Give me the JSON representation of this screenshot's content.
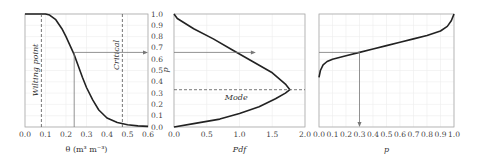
{
  "chart_data": [
    {
      "type": "line",
      "panel": "left",
      "xlabel": "θ (m³ m⁻³)",
      "ylabel": "p",
      "xlim": [
        0.0,
        0.6
      ],
      "ylim": [
        0.0,
        1.0
      ],
      "xticks": [
        "0.0",
        "0.1",
        "0.2",
        "0.3",
        "0.4",
        "0.5",
        "0.6"
      ],
      "yticks": [
        "0.0",
        "0.1",
        "0.2",
        "0.3",
        "0.4",
        "0.5",
        "0.6",
        "0.7",
        "0.8",
        "0.9",
        "1.0"
      ],
      "grid": true,
      "series": [
        {
          "name": "p(θ)",
          "x": [
            0.0,
            0.1,
            0.12,
            0.15,
            0.18,
            0.2,
            0.22,
            0.24,
            0.26,
            0.28,
            0.3,
            0.33,
            0.36,
            0.4,
            0.45,
            0.5,
            0.55,
            0.6
          ],
          "y": [
            1.0,
            1.0,
            0.99,
            0.95,
            0.87,
            0.8,
            0.72,
            0.64,
            0.54,
            0.44,
            0.35,
            0.24,
            0.15,
            0.08,
            0.04,
            0.02,
            0.01,
            0.005
          ]
        }
      ],
      "annotations": [
        {
          "text": "Wilting point",
          "x": 0.08,
          "style": "dashed vertical line"
        },
        {
          "text": "Critical",
          "x": 0.475,
          "style": "dashed vertical line"
        },
        {
          "text": "arrow",
          "from": [
            0.24,
            0.0
          ],
          "to": [
            0.24,
            0.66
          ],
          "then_to": [
            0.6,
            0.66
          ]
        }
      ]
    },
    {
      "type": "line",
      "panel": "middle",
      "xlabel": "Pdf",
      "ylabel": "p",
      "xlim": [
        0.0,
        2.0
      ],
      "ylim": [
        0.0,
        1.0
      ],
      "xticks": [
        "0.0",
        "0.5",
        "1.0",
        "1.5",
        "2.0"
      ],
      "grid": true,
      "series": [
        {
          "name": "pdf",
          "x": [
            0.0,
            0.3,
            0.7,
            1.0,
            1.3,
            1.55,
            1.7,
            1.77,
            1.7,
            1.5,
            1.2,
            0.9,
            0.6,
            0.3,
            0.05,
            0.0
          ],
          "y": [
            0.0,
            0.03,
            0.07,
            0.12,
            0.18,
            0.25,
            0.3,
            0.33,
            0.38,
            0.48,
            0.58,
            0.68,
            0.78,
            0.87,
            0.96,
            1.0
          ]
        }
      ],
      "annotations": [
        {
          "text": "Mode",
          "y": 0.33,
          "style": "dashed horizontal line"
        },
        {
          "text": "arrow",
          "from": [
            0.0,
            0.66
          ],
          "to": [
            1.25,
            0.66
          ]
        }
      ]
    },
    {
      "type": "line",
      "panel": "right",
      "xlabel": "p",
      "xlim": [
        0.0,
        1.0
      ],
      "ylim": [
        0.0,
        1.0
      ],
      "xticks": [
        "0.0",
        "0.1",
        "0.2",
        "0.3",
        "0.4",
        "0.5",
        "0.6",
        "0.7",
        "0.8",
        "0.9",
        "1.0"
      ],
      "grid": true,
      "series": [
        {
          "name": "cdf",
          "x": [
            0.0,
            0.01,
            0.03,
            0.06,
            0.1,
            0.2,
            0.3,
            0.4,
            0.5,
            0.6,
            0.7,
            0.8,
            0.9,
            0.95,
            0.98,
            1.0
          ],
          "y": [
            0.44,
            0.5,
            0.55,
            0.58,
            0.6,
            0.63,
            0.66,
            0.69,
            0.72,
            0.75,
            0.78,
            0.81,
            0.85,
            0.89,
            0.94,
            1.0
          ]
        }
      ],
      "annotations": [
        {
          "text": "arrow",
          "from": [
            0.0,
            0.66
          ],
          "to": [
            0.3,
            0.66
          ],
          "then_to": [
            0.3,
            0.0
          ]
        }
      ]
    }
  ],
  "labels": {
    "left_xlabel": "θ (m³ m⁻³)",
    "shared_ylabel": "p",
    "mid_xlabel": "Pdf",
    "right_xlabel": "p",
    "wilting": "Wilting point",
    "critical": "Critical",
    "mode": "Mode"
  }
}
